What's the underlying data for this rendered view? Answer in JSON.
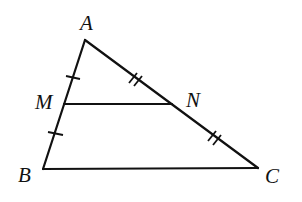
{
  "diagram": {
    "type": "triangle-midsegment",
    "points": {
      "A": {
        "label": "A",
        "x": 85,
        "y": 40,
        "label_x": 80,
        "label_y": 30
      },
      "B": {
        "label": "B",
        "x": 43,
        "y": 169,
        "label_x": 18,
        "label_y": 182
      },
      "C": {
        "label": "C",
        "x": 258,
        "y": 168,
        "label_x": 265,
        "label_y": 182
      },
      "M": {
        "label": "M",
        "x": 64,
        "y": 104,
        "label_x": 35,
        "label_y": 108
      },
      "N": {
        "label": "N",
        "x": 172,
        "y": 104,
        "label_x": 185,
        "label_y": 106
      }
    },
    "segments": [
      {
        "name": "AB",
        "from": "A",
        "to": "B"
      },
      {
        "name": "AC",
        "from": "A",
        "to": "C"
      },
      {
        "name": "BC",
        "from": "B",
        "to": "C"
      },
      {
        "name": "MN",
        "from": "M",
        "to": "N"
      }
    ],
    "tick_marks": [
      {
        "segment": "AM",
        "count": 1
      },
      {
        "segment": "MB",
        "count": 1
      },
      {
        "segment": "AN",
        "count": 2
      },
      {
        "segment": "NC",
        "count": 2
      }
    ],
    "colors": {
      "stroke": "#111111",
      "background": "#ffffff"
    }
  }
}
